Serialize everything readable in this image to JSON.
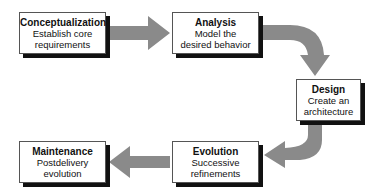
{
  "diagram": {
    "type": "process-flow",
    "stages": [
      {
        "title": "Conceptualization",
        "line1": "Establish core",
        "line2": "requirements"
      },
      {
        "title": "Analysis",
        "line1": "Model the",
        "line2": "desired behavior"
      },
      {
        "title": "Design",
        "line1": "Create an",
        "line2": "architecture"
      },
      {
        "title": "Evolution",
        "line1": "Successive",
        "line2": "refinements"
      },
      {
        "title": "Maintenance",
        "line1": "Postdelivery",
        "line2": "evolution"
      }
    ],
    "flow": [
      "Conceptualization",
      "Analysis",
      "Design",
      "Evolution",
      "Maintenance"
    ],
    "colors": {
      "arrow": "#8a8a8a",
      "box_border": "#555555",
      "shadow": "#111111"
    }
  }
}
